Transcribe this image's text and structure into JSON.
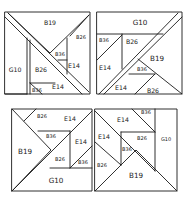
{
  "diagram": {
    "type": "quilt-block-layout",
    "stroke_color": "#1a1a1a",
    "background": "#ffffff",
    "blocks": [
      {
        "id": "top-left",
        "labels": {
          "big": "B19",
          "side": "G10",
          "mid_left": "B26",
          "small_top": "B36",
          "top_right": "B26",
          "right": "E14",
          "bottom": "E14",
          "bottom_left": "B36"
        }
      },
      {
        "id": "top-right",
        "labels": {
          "top": "G10",
          "small_left": "B36",
          "mid": "B26",
          "left": "E14",
          "big": "B19",
          "small_center": "B36",
          "bottom_left": "E14",
          "bottom_right": "B26"
        }
      },
      {
        "id": "bottom-left",
        "labels": {
          "top_left": "B26",
          "top_right": "E14",
          "small_center": "B36",
          "big": "B19",
          "right": "E14",
          "mid": "B26",
          "small_right": "B36",
          "bottom": "G10"
        }
      },
      {
        "id": "bottom-right",
        "labels": {
          "small_top": "B36",
          "top": "E14",
          "left": "E14",
          "mid": "B26",
          "side": "G10",
          "small_center": "B36",
          "bottom_left": "B26",
          "big": "B19"
        }
      }
    ]
  }
}
